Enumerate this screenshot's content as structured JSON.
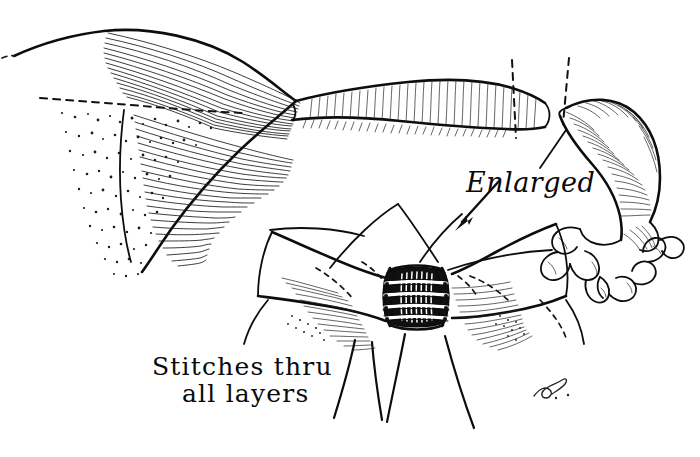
{
  "figure": {
    "medium": "pen-and-ink line drawing",
    "background_color": "#ffffff",
    "ink_color": "#111111",
    "width": 700,
    "height": 457
  },
  "labels": {
    "enlarged": {
      "text": "Enlarged",
      "style": "italic script",
      "x": 466,
      "y": 192
    },
    "stitches_line1": {
      "text": "Stitches thru",
      "style": "hand-lettered",
      "x": 152,
      "y": 375
    },
    "stitches_line2": {
      "text": "all layers",
      "style": "hand-lettered",
      "x": 182,
      "y": 402
    },
    "signature": {
      "text": "L.S.",
      "style": "artist monogram",
      "x": 545,
      "y": 398
    }
  },
  "annotations": {
    "arrow": {
      "name": "enlarged-pointer-arrow",
      "direction": "down-left",
      "from_x": 500,
      "from_y": 180,
      "to_x": 455,
      "to_y": 228
    },
    "transection_lines": [
      {
        "name": "proximal-cut-line",
        "x": 512,
        "y_top": 62,
        "y_bottom": 135
      },
      {
        "name": "distal-cut-line",
        "x": 566,
        "y_top": 62,
        "y_bottom": 120
      }
    ]
  },
  "anatomy": {
    "uterus": {
      "name": "uterine-fundus",
      "shading": "stipple and line hatching"
    },
    "proximal_tube": {
      "name": "proximal-fallopian-tube",
      "shading": "cross hatching"
    },
    "distal_segment": {
      "name": "detached-distal-tube-segment",
      "shading": "cross hatching"
    },
    "fimbriae": {
      "name": "fimbriated-end",
      "lobe_count": 9
    },
    "anastomosis": {
      "name": "anastomosis-site",
      "suture_count": 4,
      "hanging_threads": 4
    }
  }
}
